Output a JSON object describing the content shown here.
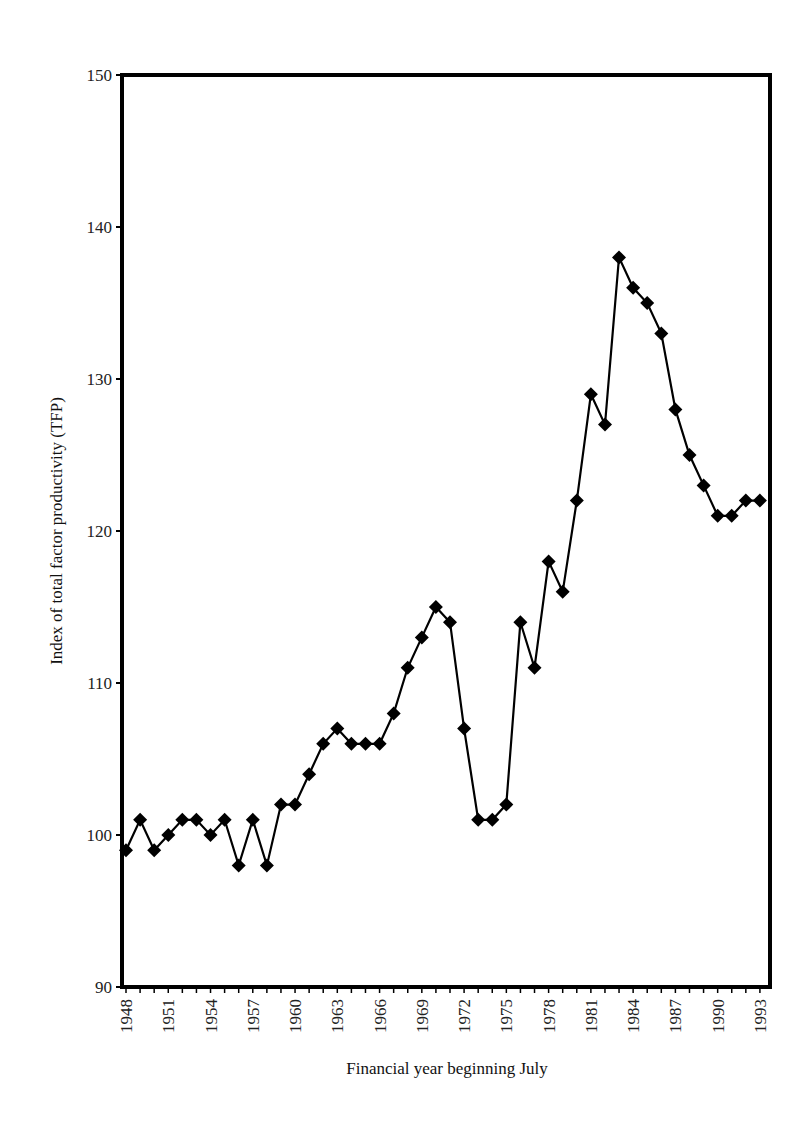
{
  "chart_data": {
    "type": "line",
    "title": "",
    "xlabel": "Financial year beginning July",
    "ylabel": "Index of total factor productivity (TFP)",
    "ylim": [
      90,
      150
    ],
    "yticks": [
      90,
      100,
      110,
      120,
      130,
      140,
      150
    ],
    "xlim": [
      1948,
      1993
    ],
    "xtick_labels": [
      "1948",
      "1951",
      "1954",
      "1957",
      "1960",
      "1963",
      "1966",
      "1969",
      "1972",
      "1975",
      "1978",
      "1981",
      "1984",
      "1987",
      "1990",
      "1993"
    ],
    "grid": false,
    "legend": null,
    "marker": "diamond",
    "series": [
      {
        "name": "TFP index",
        "x": [
          1948,
          1949,
          1950,
          1951,
          1952,
          1953,
          1954,
          1955,
          1956,
          1957,
          1958,
          1959,
          1960,
          1961,
          1962,
          1963,
          1964,
          1965,
          1966,
          1967,
          1968,
          1969,
          1970,
          1971,
          1972,
          1973,
          1974,
          1975,
          1976,
          1977,
          1978,
          1979,
          1980,
          1981,
          1982,
          1983,
          1984,
          1985,
          1986,
          1987,
          1988,
          1989,
          1990,
          1991,
          1992,
          1993
        ],
        "values": [
          99,
          101,
          99,
          100,
          101,
          101,
          100,
          101,
          98,
          101,
          98,
          102,
          102,
          104,
          106,
          107,
          106,
          106,
          106,
          108,
          111,
          113,
          115,
          114,
          107,
          101,
          101,
          102,
          114,
          111,
          118,
          116,
          122,
          129,
          127,
          138,
          136,
          135,
          133,
          128,
          125,
          123,
          121,
          121,
          122,
          122
        ]
      }
    ]
  }
}
